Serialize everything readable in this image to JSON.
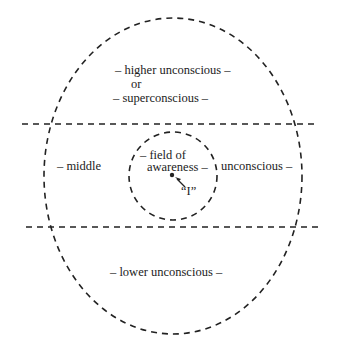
{
  "diagram": {
    "regions": {
      "higher_line1": "– higher unconscious –",
      "higher_line2": "or",
      "higher_line3": "– superconscious –",
      "middle_left": "– middle",
      "middle_right": "unconscious –",
      "field_line1": "– field of",
      "field_line2": "awareness –",
      "self_label": "“I”",
      "lower": "– lower unconscious –"
    },
    "colors": {
      "stroke": "#222222",
      "background": "#ffffff"
    }
  }
}
